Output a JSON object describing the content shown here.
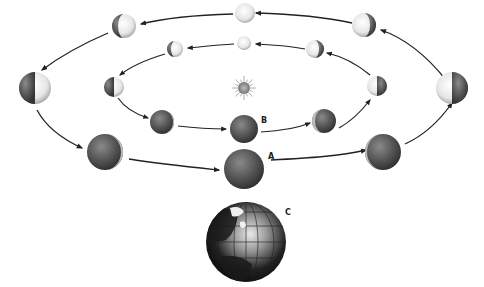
{
  "labels": {
    "a": "A",
    "b": "B",
    "c": "C"
  },
  "elements": {
    "sun": "sun-icon",
    "earth": "earth-globe-icon"
  },
  "outer_orbit": {
    "description": "Outer orbit of spheres, arrows run counterclockwise as viewed",
    "phases": [
      "full",
      "waxing-gibbous",
      "first-quarter",
      "waxing-crescent",
      "new",
      "waning-crescent",
      "third-quarter",
      "waning-gibbous"
    ]
  },
  "inner_orbit": {
    "description": "Inner orbit of smaller spheres",
    "phases": [
      "full",
      "waxing-gibbous",
      "first-quarter",
      "waxing-crescent",
      "new",
      "waning-crescent",
      "third-quarter",
      "waning-gibbous"
    ]
  },
  "colors": {
    "dark": "#4a4a4a",
    "light": "#f2f2f2",
    "arrow": "#222222"
  }
}
